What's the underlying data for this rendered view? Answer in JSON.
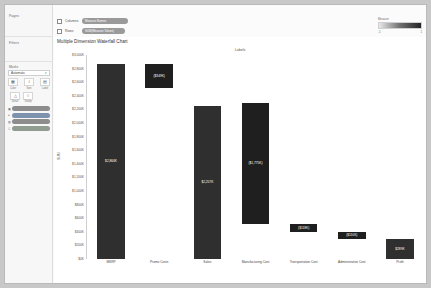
{
  "sidebar": {
    "pages_label": "Pages",
    "filters_label": "Filters",
    "marks_label": "Marks",
    "mark_type": "Automatic",
    "caret": "▾",
    "buttons": [
      {
        "name": "color",
        "glyph": "▦",
        "label": "Color"
      },
      {
        "name": "size",
        "glyph": "↕",
        "label": "Size"
      },
      {
        "name": "label",
        "glyph": "▤",
        "label": "Label"
      },
      {
        "name": "detail",
        "glyph": "△",
        "label": "Detail"
      },
      {
        "name": "tooltip",
        "glyph": "○",
        "label": "Tooltip"
      }
    ],
    "mark_pills": [
      {
        "icon": "▣",
        "text": "SUM(Measure Values)",
        "tone": "grey"
      },
      {
        "icon": "●",
        "text": "Measure Names",
        "tone": "blue"
      },
      {
        "icon": "▤",
        "text": "SUM(Values)",
        "tone": "grey"
      },
      {
        "icon": "△",
        "text": "Profit",
        "tone": "grn"
      }
    ]
  },
  "shelves": {
    "columns_label": "Columns",
    "columns_pill": "Measure Names",
    "rows_label": "Rows",
    "rows_pill": "SUM(Measure Values)"
  },
  "legend": {
    "title": "Measure",
    "min": "-1",
    "max": "1"
  },
  "chart_data": {
    "type": "bar",
    "title": "Multiple Dimension Waterfall Chart",
    "header": "Labels",
    "xlabel": "",
    "ylabel": "SUM",
    "ylim": [
      0,
      3000
    ],
    "ytick_labels": [
      "$3,000K",
      "$2,800K",
      "$2,600K",
      "$2,400K",
      "$2,200K",
      "$2,000K",
      "$1,800K",
      "$1,600K",
      "$1,400K",
      "$1,200K",
      "$1,000K",
      "$800K",
      "$600K",
      "$400K",
      "$200K",
      "$0K"
    ],
    "ytick_values": [
      3000,
      2800,
      2600,
      2400,
      2200,
      2000,
      1800,
      1600,
      1400,
      1200,
      1000,
      800,
      600,
      400,
      200,
      0
    ],
    "grid": false,
    "legend_position": "top-right",
    "categories": [
      "MSRP",
      "Promo Costs",
      "Sales",
      "Manufacturing Cost",
      "Transportation Cost",
      "Administrative Cost",
      "Profit"
    ],
    "bars": [
      {
        "category": "MSRP",
        "label": "$2,864K",
        "value": 2864,
        "base": 0,
        "top": 2864,
        "direction": "total"
      },
      {
        "category": "Promo Costs",
        "label": "($349K)",
        "value": -349,
        "base": 2515,
        "top": 2864,
        "direction": "down"
      },
      {
        "category": "Sales",
        "label": "$2,257K",
        "value": 2257,
        "base": 0,
        "top": 2257,
        "direction": "total"
      },
      {
        "category": "Manufacturing Cost",
        "label": "($1,775K)",
        "value": -1775,
        "base": 517,
        "top": 2292,
        "direction": "down"
      },
      {
        "category": "Transportation Cost",
        "label": "($118K)",
        "value": -118,
        "base": 399,
        "top": 517,
        "direction": "down"
      },
      {
        "category": "Administrative Cost",
        "label": "($110K)",
        "value": -110,
        "base": 289,
        "top": 399,
        "direction": "down"
      },
      {
        "category": "Profit",
        "label": "$289K",
        "value": 289,
        "base": 0,
        "top": 289,
        "direction": "total"
      }
    ]
  }
}
